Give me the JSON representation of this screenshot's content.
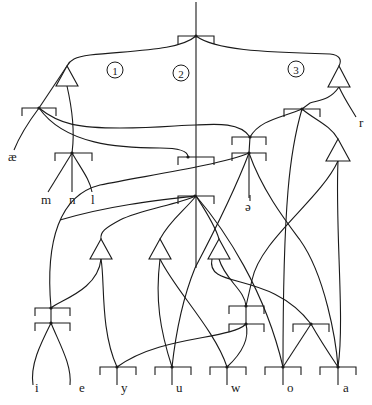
{
  "diagram": {
    "type": "feature-geometry tree",
    "colors": {
      "stroke": "#1a1a1a",
      "background": "#ffffff"
    },
    "circled_labels": [
      {
        "text": "1",
        "x": 115,
        "y": 70
      },
      {
        "text": "2",
        "x": 181,
        "y": 73
      },
      {
        "text": "3",
        "x": 296,
        "y": 69
      }
    ],
    "segment_labels": [
      {
        "text": "æ",
        "x": 8,
        "y": 161
      },
      {
        "text": "m",
        "x": 41,
        "y": 204
      },
      {
        "text": "n",
        "x": 69,
        "y": 204
      },
      {
        "text": "l",
        "x": 91,
        "y": 204
      },
      {
        "text": "r",
        "x": 359,
        "y": 127
      },
      {
        "text": "ə",
        "x": 245,
        "y": 211
      },
      {
        "text": "i",
        "x": 35,
        "y": 392
      },
      {
        "text": "e",
        "x": 79,
        "y": 392
      },
      {
        "text": "y",
        "x": 121,
        "y": 392
      },
      {
        "text": "u",
        "x": 176,
        "y": 392
      },
      {
        "text": "w",
        "x": 231,
        "y": 392
      },
      {
        "text": "o",
        "x": 287,
        "y": 392
      },
      {
        "text": "a",
        "x": 343,
        "y": 392
      }
    ],
    "nodes": [
      {
        "id": "root",
        "x": 196,
        "y": 36,
        "bl": 178,
        "br": 214
      },
      {
        "id": "ae",
        "x": 39,
        "y": 108,
        "bl": 22,
        "br": 56
      },
      {
        "id": "mnl",
        "x": 72,
        "y": 153,
        "bl": 55,
        "br": 92
      },
      {
        "id": "right",
        "x": 302,
        "y": 109,
        "bl": 284,
        "br": 320
      },
      {
        "id": "mid-upper",
        "x": 188,
        "y": 157,
        "bl": 178,
        "br": 214
      },
      {
        "id": "schwa-upper",
        "x": 250,
        "y": 137,
        "bl": 232,
        "br": 266
      },
      {
        "id": "schwa-lower",
        "x": 249,
        "y": 153,
        "bl": 232,
        "br": 266
      },
      {
        "id": "center",
        "x": 195,
        "y": 196,
        "bl": 178,
        "br": 214
      },
      {
        "id": "ie-upper",
        "x": 51,
        "y": 308,
        "bl": 35,
        "br": 70
      },
      {
        "id": "ie-lower",
        "x": 51,
        "y": 323,
        "bl": 35,
        "br": 70
      },
      {
        "id": "w-upper",
        "x": 246,
        "y": 306,
        "bl": 229,
        "br": 264
      },
      {
        "id": "w-lower",
        "x": 246,
        "y": 324,
        "bl": 229,
        "br": 264
      },
      {
        "id": "oa",
        "x": 311,
        "y": 324,
        "bl": 293,
        "br": 329
      },
      {
        "id": "y",
        "x": 117,
        "y": 367,
        "bl": 100,
        "br": 136
      },
      {
        "id": "u",
        "x": 172,
        "y": 367,
        "bl": 155,
        "br": 191
      },
      {
        "id": "w",
        "x": 227,
        "y": 367,
        "bl": 210,
        "br": 246
      },
      {
        "id": "o",
        "x": 283,
        "y": 367,
        "bl": 265,
        "br": 301
      },
      {
        "id": "a",
        "x": 338,
        "y": 367,
        "bl": 320,
        "br": 356
      }
    ],
    "triangles": [
      {
        "id": "tri-1",
        "x": 67,
        "y": 66,
        "w": 22,
        "h": 20
      },
      {
        "id": "tri-3",
        "x": 339,
        "y": 66,
        "w": 22,
        "h": 21
      },
      {
        "id": "tri-right",
        "x": 338,
        "y": 139,
        "w": 24,
        "h": 22
      },
      {
        "id": "tri-A",
        "x": 101,
        "y": 239,
        "w": 22,
        "h": 20
      },
      {
        "id": "tri-B",
        "x": 160,
        "y": 239,
        "w": 22,
        "h": 20
      },
      {
        "id": "tri-C",
        "x": 219,
        "y": 239,
        "w": 22,
        "h": 20
      }
    ],
    "paths": [
      "M196 2 L196 268",
      "M196 36 C180 50, 140 50, 90 55 C75 57, 70 60, 67 66",
      "M196 36 C215 50, 260 52, 330 54 C340 55, 342 60, 339 66",
      "M67 86 C77 130, 72 150, 72 153",
      "M67 66 L39 108",
      "M39 108 C30 120, 20 135, 14 150",
      "M39 108 C60 125, 80 128, 120 128 C160 128, 180 125, 196 125",
      "M39 108 C65 145, 120 148, 160 148 C180 148, 188 152, 188 157",
      "M72 153 L48 192",
      "M72 153 L72 192",
      "M72 153 C82 170, 90 180, 92 192",
      "M339 87 C345 100, 352 110, 356 117",
      "M339 87 C330 100, 320 100, 310 103 L302 109",
      "M302 109 C280 118, 260 120, 250 137",
      "M250 137 C240 122, 215 124, 196 125",
      "M250 137 L249 153",
      "M249 153 L249 198",
      "M249 153 C220 165, 150 175, 100 185 C60 195, 45 240, 51 308",
      "M249 153 C235 190, 215 230, 195 268 C182 300, 175 340, 172 367",
      "M249 153 C262 190, 285 220, 300 240 C325 275, 336 340, 338 367",
      "M302 109 C290 150, 283 200, 283 367",
      "M302 109 C315 120, 330 125, 338 139",
      "M338 161 C335 230, 345 320, 338 367",
      "M338 161 C320 200, 260 240, 252 280 L246 306",
      "M196 196 C175 205, 140 210, 120 220 C105 228, 100 232, 101 239",
      "M196 196 C185 210, 170 220, 160 239",
      "M196 196 C205 210, 215 225, 219 239",
      "M196 196 C225 230, 265 290, 283 367",
      "M196 196 C160 200, 110 205, 60 220",
      "M101 259 C98 290, 60 300, 51 308",
      "M101 259 C105 280, 100 330, 117 367",
      "M160 259 C155 300, 160 330, 172 367",
      "M160 259 C175 290, 215 330, 227 367",
      "M219 259 C225 280, 245 290, 246 306",
      "M212 259 C205 290, 270 270, 311 324",
      "M51 308 L51 323",
      "M51 323 C40 345, 30 365, 33 385",
      "M51 323 C60 345, 72 365, 70 385",
      "M246 306 L246 324",
      "M246 324 C230 340, 160 335, 117 367",
      "M246 324 C250 340, 240 355, 227 367",
      "M311 324 L283 367",
      "M311 324 C320 340, 330 355, 338 367",
      "M117 367 L117 385",
      "M172 367 L172 385",
      "M227 367 L227 385",
      "M283 367 L283 385",
      "M338 367 L338 385",
      "M250 195 L250 201"
    ]
  }
}
